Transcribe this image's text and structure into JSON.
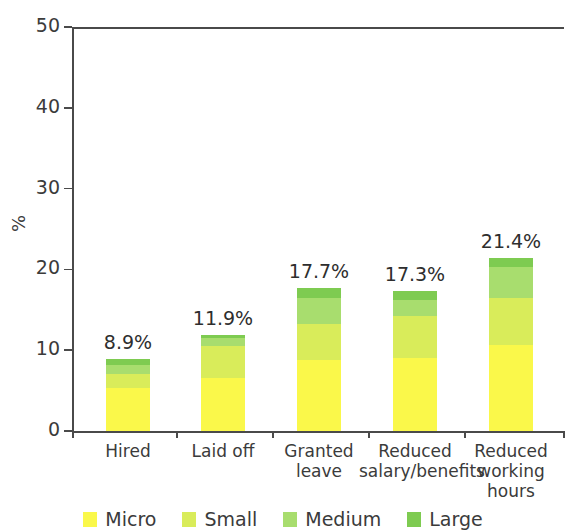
{
  "chart_data": {
    "type": "bar",
    "subtype": "stacked-bar",
    "title": "",
    "xlabel": "",
    "ylabel": "%",
    "ylim": [
      0,
      50
    ],
    "yticks": [
      0,
      10,
      20,
      30,
      40,
      50
    ],
    "grid": false,
    "legend_position": "bottom",
    "categories": [
      "Hired",
      "Laid off",
      "Granted leave",
      "Reduced salary/benefits",
      "Reduced working hours"
    ],
    "category_label_lines": [
      [
        "Hired"
      ],
      [
        "Laid off"
      ],
      [
        "Granted",
        "leave"
      ],
      [
        "Reduced",
        "salary/benefits"
      ],
      [
        "Reduced",
        "working",
        "hours"
      ]
    ],
    "series": [
      {
        "name": "Micro",
        "color": "#faf84a",
        "values": [
          5.3,
          6.5,
          8.8,
          9.0,
          10.6
        ]
      },
      {
        "name": "Small",
        "color": "#d9ec5a",
        "values": [
          1.7,
          4.0,
          4.5,
          5.2,
          5.9
        ]
      },
      {
        "name": "Medium",
        "color": "#a8dd6e",
        "values": [
          1.2,
          1.0,
          3.2,
          2.0,
          3.8
        ]
      },
      {
        "name": "Large",
        "color": "#7ecb51",
        "values": [
          0.7,
          0.4,
          1.2,
          1.1,
          1.1
        ]
      }
    ],
    "totals": [
      8.9,
      11.9,
      17.7,
      17.3,
      21.4
    ],
    "total_labels": [
      "8.9%",
      "11.9%",
      "17.7%",
      "17.3%",
      "21.4%"
    ],
    "legend": [
      {
        "label": "Micro",
        "color": "#faf84a"
      },
      {
        "label": "Small",
        "color": "#d9ec5a"
      },
      {
        "label": "Medium",
        "color": "#a8dd6e"
      },
      {
        "label": "Large",
        "color": "#7ecb51"
      }
    ],
    "ytick_labels": [
      "50",
      "40",
      "30",
      "20",
      "10",
      "0"
    ]
  }
}
